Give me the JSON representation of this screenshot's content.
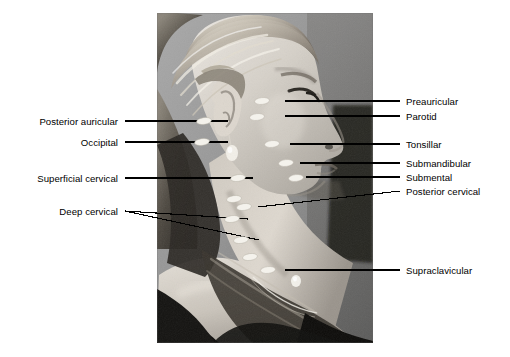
{
  "figure": {
    "kind": "anatomical-photograph-diagram",
    "photo": {
      "left": 157,
      "top": 13,
      "width": 216,
      "height": 330,
      "tone": "black-and-white",
      "marker_shape": "white oval",
      "marker_count": 14
    },
    "background_color": "#ffffff",
    "leader_color": "#000000",
    "text_color": "#000000"
  },
  "labels_left": [
    {
      "id": "posterior-auricular",
      "text": "Posterior auricular",
      "text_x": 118,
      "text_y": 121,
      "leaders": [
        {
          "x1": 125,
          "y1": 121,
          "x2": 228,
          "y2": 121
        }
      ]
    },
    {
      "id": "occipital",
      "text": "Occipital",
      "text_x": 118,
      "text_y": 142,
      "leaders": [
        {
          "x1": 125,
          "y1": 142,
          "x2": 228,
          "y2": 142
        }
      ]
    },
    {
      "id": "superficial-cervical",
      "text": "Superficial cervical",
      "text_x": 118,
      "text_y": 178,
      "leaders": [
        {
          "x1": 125,
          "y1": 178,
          "x2": 253,
          "y2": 178
        }
      ]
    },
    {
      "id": "deep-cervical",
      "text": "Deep cervical",
      "text_x": 118,
      "text_y": 211,
      "leaders": [
        {
          "x1": 125,
          "y1": 211,
          "x2": 248,
          "y2": 219
        },
        {
          "x1": 125,
          "y1": 211,
          "x2": 259,
          "y2": 240
        }
      ]
    }
  ],
  "labels_right": [
    {
      "id": "preauricular",
      "text": "Preauricular",
      "text_x": 406,
      "text_y": 101,
      "leaders": [
        {
          "x1": 285,
          "y1": 101,
          "x2": 400,
          "y2": 101
        }
      ]
    },
    {
      "id": "parotid",
      "text": "Parotid",
      "text_x": 406,
      "text_y": 116,
      "leaders": [
        {
          "x1": 285,
          "y1": 116,
          "x2": 400,
          "y2": 116
        }
      ]
    },
    {
      "id": "tonsillar",
      "text": "Tonsillar",
      "text_x": 406,
      "text_y": 144,
      "leaders": [
        {
          "x1": 290,
          "y1": 144,
          "x2": 400,
          "y2": 144
        }
      ]
    },
    {
      "id": "submandibular",
      "text": "Submandibular",
      "text_x": 406,
      "text_y": 163,
      "leaders": [
        {
          "x1": 300,
          "y1": 163,
          "x2": 400,
          "y2": 163
        }
      ]
    },
    {
      "id": "submental",
      "text": "Submental",
      "text_x": 406,
      "text_y": 177,
      "leaders": [
        {
          "x1": 306,
          "y1": 177,
          "x2": 400,
          "y2": 177
        }
      ]
    },
    {
      "id": "posterior-cervical",
      "text": "Posterior cervical",
      "text_x": 406,
      "text_y": 191,
      "leaders": [
        {
          "x1": 258,
          "y1": 207,
          "x2": 400,
          "y2": 191
        }
      ]
    },
    {
      "id": "supraclavicular",
      "text": "Supraclavicular",
      "text_x": 406,
      "text_y": 270,
      "leaders": [
        {
          "x1": 285,
          "y1": 270,
          "x2": 400,
          "y2": 270
        }
      ]
    }
  ],
  "node_markers": [
    {
      "id": "marker-posterior-auricular",
      "cx": 204,
      "cy": 121,
      "rx": 7.5,
      "ry": 3.4,
      "angle": -8
    },
    {
      "id": "marker-occipital",
      "cx": 202,
      "cy": 142,
      "rx": 7.5,
      "ry": 3.4,
      "angle": -8
    },
    {
      "id": "marker-preauricular",
      "cx": 262,
      "cy": 101,
      "rx": 7.5,
      "ry": 3.4,
      "angle": -6
    },
    {
      "id": "marker-parotid",
      "cx": 257,
      "cy": 117,
      "rx": 7.5,
      "ry": 3.4,
      "angle": -6
    },
    {
      "id": "marker-tonsillar",
      "cx": 272,
      "cy": 144,
      "rx": 7.5,
      "ry": 3.4,
      "angle": -6
    },
    {
      "id": "marker-submandibular",
      "cx": 286,
      "cy": 163,
      "rx": 7.5,
      "ry": 3.4,
      "angle": -6
    },
    {
      "id": "marker-submental",
      "cx": 296,
      "cy": 178,
      "rx": 7.5,
      "ry": 3.4,
      "angle": -6
    },
    {
      "id": "marker-superficial-cervical",
      "cx": 238,
      "cy": 178,
      "rx": 7.5,
      "ry": 3.4,
      "angle": -8
    },
    {
      "id": "marker-deep-cervical-upper",
      "cx": 234,
      "cy": 199,
      "rx": 7.5,
      "ry": 3.4,
      "angle": -8
    },
    {
      "id": "marker-deep-cervical-mid",
      "cx": 232,
      "cy": 219,
      "rx": 7.5,
      "ry": 3.4,
      "angle": -8
    },
    {
      "id": "marker-posterior-cervical",
      "cx": 244,
      "cy": 207,
      "rx": 7.5,
      "ry": 3.4,
      "angle": -8
    },
    {
      "id": "marker-deep-cervical-lower",
      "cx": 241,
      "cy": 240,
      "rx": 7.5,
      "ry": 3.4,
      "angle": -8
    },
    {
      "id": "marker-lower-chain",
      "cx": 250,
      "cy": 257,
      "rx": 7.5,
      "ry": 3.4,
      "angle": -8
    },
    {
      "id": "marker-supraclavicular",
      "cx": 268,
      "cy": 270,
      "rx": 7.5,
      "ry": 3.4,
      "angle": -6
    }
  ]
}
